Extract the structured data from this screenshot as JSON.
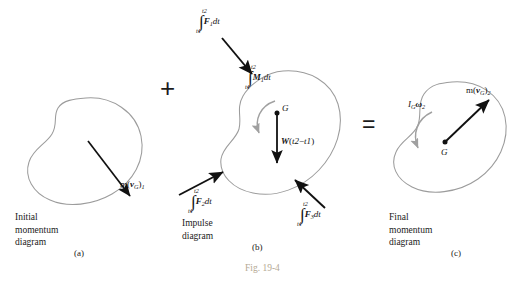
{
  "figure": {
    "number": "Fig. 19-4",
    "operators": {
      "plus": "+",
      "equals": "="
    }
  },
  "panels": [
    {
      "id": "initial-momentum",
      "part": "(a)",
      "caption_lines": [
        "Initial",
        "momentum",
        "diagram"
      ],
      "vectors": [
        {
          "name": "linear-momentum-initial",
          "label_plain": "m(vG)1",
          "label_parts": {
            "m": "m",
            "paren_open": "(",
            "vector": "v",
            "sub_vector": "G",
            "paren_close": ")",
            "sub_state": "1"
          }
        }
      ]
    },
    {
      "id": "impulse",
      "part": "(b)",
      "caption_lines": [
        "Impulse",
        "diagram"
      ],
      "center_label": "G",
      "vectors": [
        {
          "name": "impulse-force-1",
          "label_plain": "∫ F1 dt",
          "label_parts": {
            "integral": "∫",
            "upper_limit": "t2",
            "lower_limit": "t1",
            "vector": "F",
            "sub_vector": "1",
            "differential": "dt"
          }
        },
        {
          "name": "impulse-force-2",
          "label_plain": "∫ F2 dt",
          "label_parts": {
            "integral": "∫",
            "upper_limit": "t2",
            "lower_limit": "t1",
            "vector": "F",
            "sub_vector": "2",
            "differential": "dt"
          }
        },
        {
          "name": "impulse-force-3",
          "label_plain": "∫ F3 dt",
          "label_parts": {
            "integral": "∫",
            "upper_limit": "t2",
            "lower_limit": "t1",
            "vector": "F",
            "sub_vector": "3",
            "differential": "dt"
          }
        },
        {
          "name": "angular-impulse-moment",
          "label_plain": "∫ M1 dt",
          "label_parts": {
            "integral": "∫",
            "upper_limit": "t2",
            "lower_limit": "t1",
            "vector": "M",
            "sub_vector": "1",
            "differential": "dt"
          }
        },
        {
          "name": "weight-impulse",
          "label_plain": "W(t2 - t1)",
          "label_parts": {
            "vector": "W",
            "paren_open": "(",
            "t_upper": "t2",
            "minus": "−",
            "t_lower": "t1",
            "paren_close": ")"
          }
        }
      ]
    },
    {
      "id": "final-momentum",
      "part": "(c)",
      "caption_lines": [
        "Final",
        "momentum",
        "diagram"
      ],
      "center_label": "G",
      "vectors": [
        {
          "name": "linear-momentum-final",
          "label_plain": "m(vG)2",
          "label_parts": {
            "m": "m",
            "paren_open": "(",
            "vector": "v",
            "sub_vector": "G",
            "paren_close": ")",
            "sub_state": "2"
          }
        },
        {
          "name": "angular-momentum-final",
          "label_plain": "IG ω2",
          "label_parts": {
            "inertia": "I",
            "sub_inertia": "G",
            "omega": "ω",
            "sub_omega": "2"
          }
        }
      ]
    }
  ],
  "colors": {
    "body_outline": "#9c9c9c",
    "vector_black": "#111111",
    "curved_arrow_gray": "#a0a0a0",
    "figure_caption": "#b5a994",
    "text": "#1a1a1a"
  }
}
